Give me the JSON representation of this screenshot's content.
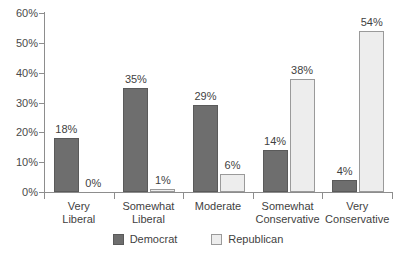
{
  "chart_data": {
    "type": "bar",
    "title": "",
    "subtitle": "",
    "xlabel": "",
    "ylabel": "",
    "grid": false,
    "legend_position": "bottom",
    "ylim": [
      0,
      60
    ],
    "y_ticks": [
      "0%",
      "10%",
      "20%",
      "30%",
      "40%",
      "50%",
      "60%"
    ],
    "y_tick_values": [
      0,
      10,
      20,
      30,
      40,
      50,
      60
    ],
    "categories": [
      "Very Liberal",
      "Somewhat Liberal",
      "Moderate",
      "Somewhat Conservative",
      "Very Conservative"
    ],
    "category_lines": [
      [
        "Very",
        "Liberal"
      ],
      [
        "Somewhat",
        "Liberal"
      ],
      [
        "Moderate",
        ""
      ],
      [
        "Somewhat",
        "Conservative"
      ],
      [
        "Very",
        "Conservative"
      ]
    ],
    "series": [
      {
        "name": "Democrat",
        "color": "#6E6E6E",
        "values": [
          18,
          35,
          29,
          14,
          4
        ],
        "labels": [
          "18%",
          "35%",
          "29%",
          "14%",
          "4%"
        ]
      },
      {
        "name": "Republican",
        "color": "#EDEDED",
        "values": [
          0,
          1,
          6,
          38,
          54
        ],
        "labels": [
          "0%",
          "1%",
          "6%",
          "38%",
          "54%"
        ]
      }
    ]
  },
  "legend": {
    "items": [
      {
        "label": "Democrat",
        "swatch": "dem"
      },
      {
        "label": "Republican",
        "swatch": "rep"
      }
    ]
  },
  "colors": {
    "democrat": "#6E6E6E",
    "republican": "#EDEDED",
    "axis": "#8D8D8D",
    "text": "#3F3F3F",
    "background": "#FFFFFF"
  }
}
